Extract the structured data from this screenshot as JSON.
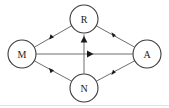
{
  "diagram": {
    "type": "directed-graph",
    "width": 169,
    "height": 108,
    "background_color": "#ffffff",
    "node_stroke_color": "#3a3a3a",
    "node_fill_color": "#ffffff",
    "edge_color": "#6e6e6e",
    "arrow_color": "#1a1a1a",
    "node_radius": 14,
    "nodes": [
      {
        "id": "M",
        "label": "M",
        "cx": 22,
        "cy": 54
      },
      {
        "id": "R",
        "label": "R",
        "cx": 84,
        "cy": 19
      },
      {
        "id": "N",
        "label": "N",
        "cx": 84,
        "cy": 88
      },
      {
        "id": "A",
        "label": "A",
        "cx": 147,
        "cy": 54
      }
    ],
    "edges": [
      {
        "id": "M-R",
        "from": "M",
        "to": "R",
        "directed": true,
        "arrow_position": "mid"
      },
      {
        "id": "M-N",
        "from": "M",
        "to": "N",
        "directed": true,
        "arrow_position": "mid"
      },
      {
        "id": "M-A",
        "from": "M",
        "to": "A",
        "directed": true,
        "arrow_position": "mid"
      },
      {
        "id": "N-R",
        "from": "N",
        "to": "R",
        "directed": true,
        "arrow_position": "mid"
      },
      {
        "id": "R-A",
        "from": "R",
        "to": "A",
        "directed": true,
        "arrow_position": "mid"
      },
      {
        "id": "N-A",
        "from": "N",
        "to": "A",
        "directed": true,
        "arrow_position": "mid"
      }
    ]
  }
}
